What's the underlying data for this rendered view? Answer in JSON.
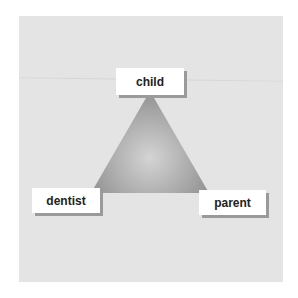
{
  "diagram": {
    "type": "triangle",
    "nodes": [
      {
        "id": "top",
        "label": "child"
      },
      {
        "id": "left",
        "label": "dentist"
      },
      {
        "id": "right",
        "label": "parent"
      }
    ]
  },
  "colors": {
    "panel": "#e4e4e4",
    "triangle_center": "#d2d2d2",
    "triangle_edge": "#8c8c8c",
    "label_bg": "#ffffff",
    "label_shadow": "#9a9a9a"
  }
}
